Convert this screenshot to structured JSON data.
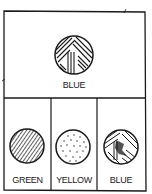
{
  "panels": {
    "top": {
      "label": "BLUE",
      "pattern": "crosshatch-strands"
    },
    "bottom": [
      {
        "label": "GREEN",
        "pattern": "diagonal-stripes"
      },
      {
        "label": "YELLOW",
        "pattern": "dots"
      },
      {
        "label": "BLUE",
        "pattern": "mixed-strands"
      }
    ]
  },
  "colors": {
    "ink": "#1a1a1a",
    "background": "#ffffff"
  }
}
